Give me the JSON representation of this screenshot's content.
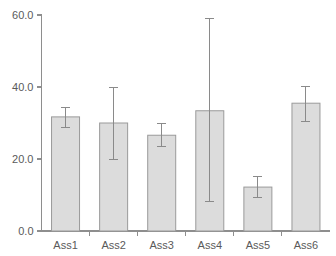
{
  "chart_data": {
    "type": "bar",
    "title": "",
    "subtitle": "",
    "xlabel": "",
    "ylabel": "",
    "categories": [
      "Ass1",
      "Ass2",
      "Ass3",
      "Ass4",
      "Ass5",
      "Ass6"
    ],
    "values": [
      31.7,
      30.0,
      26.6,
      33.4,
      12.2,
      35.5
    ],
    "error_low": [
      28.8,
      20.0,
      23.4,
      8.3,
      9.3,
      30.5
    ],
    "error_high": [
      34.3,
      39.8,
      29.8,
      59.0,
      15.1,
      40.1
    ],
    "ylim": [
      0.0,
      60.0
    ],
    "y_ticks": [
      0.0,
      20.0,
      40.0,
      60.0
    ],
    "y_tick_labels": [
      "0.0",
      "20.0",
      "40.0",
      "60.0"
    ],
    "grid": false,
    "legend": null,
    "legend_position": "none",
    "bar_color": "#dcdcdc",
    "bar_edge_color": "#9a9a9a",
    "error_bar_color": "#8a8a8a",
    "axis_color": "#8e8e8e",
    "label_color": "#5a5a5a",
    "background_color": "#ffffff"
  }
}
